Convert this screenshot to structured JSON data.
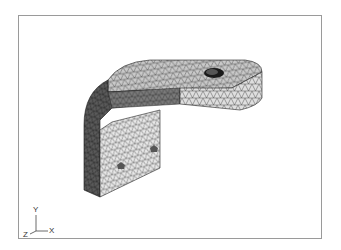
{
  "viewport": {
    "border_color": "#9a9a9a",
    "background": "#ffffff"
  },
  "model": {
    "description": "FEA tetrahedral mesh of an L-shaped bracket with a through-hole",
    "colors": {
      "top_face": "#c9c9c9",
      "curved_side": "#555555",
      "front_face": "#dcdcdc",
      "lower_face": "#e6e6e6",
      "mesh_line": "#333333",
      "hole": "#1a1a1a"
    }
  },
  "axis_triad": {
    "y_label": "Y",
    "x_label": "X",
    "z_label": "Z"
  }
}
